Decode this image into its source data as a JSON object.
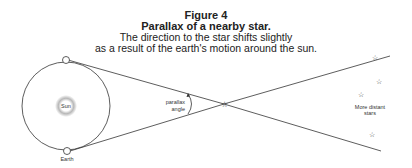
{
  "caption": {
    "figure_number": "Figure 4",
    "title": "Parallax of a nearby star.",
    "description_line1": "The direction to the star shifts slightly",
    "description_line2": "as a result of the earth's motion around the sun."
  },
  "diagram": {
    "sun_label": "Sun",
    "earth_label": "Earth",
    "angle_label_line1": "parallax",
    "angle_label_line2": "angle",
    "distant_label_line1": "More distant",
    "distant_label_line2": "stars",
    "colors": {
      "line": "#333333",
      "sun_glow": "#b8b8b8"
    }
  }
}
